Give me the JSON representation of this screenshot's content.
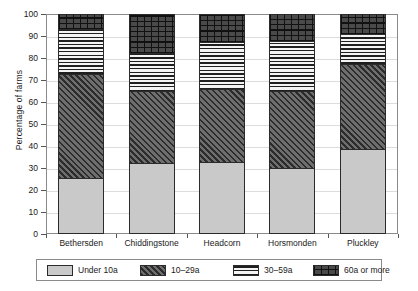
{
  "chart_data": {
    "type": "bar",
    "stacked": true,
    "stack_total": 100,
    "title": "",
    "xlabel": "",
    "ylabel": "Percentage of farms",
    "ylim": [
      0,
      100
    ],
    "yticks": [
      0,
      10,
      20,
      30,
      40,
      50,
      60,
      70,
      80,
      90,
      100
    ],
    "ytick_labels": [
      "0",
      "10",
      "20",
      "30",
      "40",
      "50",
      "60",
      "70",
      "80",
      "90",
      "100"
    ],
    "grid": true,
    "legend_position": "bottom",
    "categories": [
      "Bethersden",
      "Chiddingstone",
      "Headcorn",
      "Horsmonden",
      "Pluckley"
    ],
    "series": [
      {
        "name": "Under 10a",
        "pattern": "solid-light-gray",
        "color": "#c9c9c9",
        "values": [
          25.0,
          31.5,
          32.0,
          29.5,
          38.0
        ]
      },
      {
        "name": "10–29a",
        "pattern": "diagonal-hatch",
        "color": "#6e6e6e",
        "values": [
          47.5,
          33.0,
          33.5,
          35.0,
          39.0
        ]
      },
      {
        "name": "30–59a",
        "pattern": "horizontal-lines",
        "color": "#f2f2f2",
        "values": [
          20.5,
          17.5,
          21.5,
          23.0,
          14.0
        ]
      },
      {
        "name": "60a or more",
        "pattern": "brick-crosshatch",
        "color": "#4a4a4a",
        "values": [
          7.0,
          18.0,
          13.0,
          12.5,
          9.0
        ]
      }
    ],
    "cumulative_tops": {
      "Bethersden": [
        25.0,
        72.5,
        93.0,
        100
      ],
      "Chiddingstone": [
        31.5,
        64.5,
        82.0,
        100
      ],
      "Headcorn": [
        32.0,
        65.5,
        87.0,
        100
      ],
      "Horsmonden": [
        29.5,
        64.5,
        87.5,
        100
      ],
      "Pluckley": [
        38.0,
        77.0,
        91.0,
        100
      ]
    }
  },
  "axis": {
    "y_title": "Percentage of farms"
  },
  "legend": {
    "items": [
      {
        "label": "Under 10a"
      },
      {
        "label": "10–29a"
      },
      {
        "label": "30–59a"
      },
      {
        "label": "60a or more"
      }
    ]
  }
}
